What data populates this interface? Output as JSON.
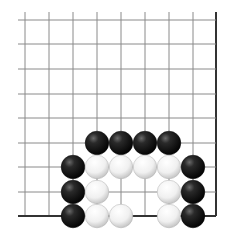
{
  "board": {
    "description": "Go board diagram, lower-right corner region (right and bottom edges shown)",
    "columns": 9,
    "rows": 9,
    "col_x": [
      25,
      49,
      73,
      97,
      121,
      145,
      169,
      193,
      216
    ],
    "row_y": [
      20,
      44,
      69,
      94,
      118,
      143,
      167,
      192,
      216
    ],
    "line_start_x": 18,
    "line_start_y": 12,
    "edge_right": true,
    "edge_bottom": true,
    "stone_radius": 11.8,
    "colors": {
      "grid_line": "#8a8a8a",
      "edge_line": "#333333",
      "black_stone": "#1a1a1a",
      "white_stone": "#f2f2f2"
    }
  },
  "stones": [
    {
      "color": "black",
      "col": 3,
      "row": 5
    },
    {
      "color": "black",
      "col": 4,
      "row": 5
    },
    {
      "color": "black",
      "col": 5,
      "row": 5
    },
    {
      "color": "black",
      "col": 6,
      "row": 5
    },
    {
      "color": "black",
      "col": 2,
      "row": 6
    },
    {
      "color": "white",
      "col": 3,
      "row": 6
    },
    {
      "color": "white",
      "col": 4,
      "row": 6
    },
    {
      "color": "white",
      "col": 5,
      "row": 6
    },
    {
      "color": "white",
      "col": 6,
      "row": 6
    },
    {
      "color": "black",
      "col": 7,
      "row": 6
    },
    {
      "color": "black",
      "col": 2,
      "row": 7
    },
    {
      "color": "white",
      "col": 3,
      "row": 7
    },
    {
      "color": "white",
      "col": 6,
      "row": 7
    },
    {
      "color": "black",
      "col": 7,
      "row": 7
    },
    {
      "color": "black",
      "col": 2,
      "row": 8
    },
    {
      "color": "white",
      "col": 3,
      "row": 8
    },
    {
      "color": "white",
      "col": 4,
      "row": 8
    },
    {
      "color": "white",
      "col": 6,
      "row": 8
    },
    {
      "color": "black",
      "col": 7,
      "row": 8
    }
  ]
}
